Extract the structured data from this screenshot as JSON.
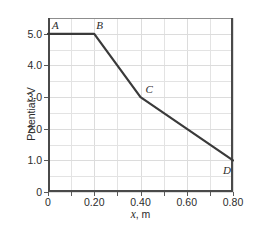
{
  "chart_data": {
    "type": "line",
    "title": "",
    "xlabel": "x, m",
    "ylabel": "Potential, V",
    "xlim": [
      0,
      0.8
    ],
    "ylim": [
      0,
      5.5
    ],
    "grid": true,
    "legend": "none",
    "x": [
      0.0,
      0.2,
      0.4,
      0.8
    ],
    "y": [
      5.0,
      5.0,
      3.0,
      1.0
    ],
    "point_labels": [
      "A",
      "B",
      "C",
      "D"
    ],
    "points": [
      {
        "label": "A",
        "x": 0.0,
        "y": 5.0
      },
      {
        "label": "B",
        "x": 0.2,
        "y": 5.0
      },
      {
        "label": "C",
        "x": 0.4,
        "y": 3.0
      },
      {
        "label": "D",
        "x": 0.8,
        "y": 1.0
      }
    ],
    "xticks": [
      {
        "value": 0.0,
        "label": "0"
      },
      {
        "value": 0.2,
        "label": "0.20"
      },
      {
        "value": 0.4,
        "label": "0.40"
      },
      {
        "value": 0.6,
        "label": "0.60"
      },
      {
        "value": 0.8,
        "label": "0.80"
      }
    ],
    "yticks": [
      {
        "value": 0.0,
        "label": "0"
      },
      {
        "value": 1.0,
        "label": "1.0"
      },
      {
        "value": 2.0,
        "label": "2.0"
      },
      {
        "value": 3.0,
        "label": "3.0"
      },
      {
        "value": 4.0,
        "label": "4.0"
      },
      {
        "value": 5.0,
        "label": "5.0"
      }
    ],
    "minor_x_step": 0.1,
    "minor_y_step": 0.5,
    "colors": {
      "line": "#3a3a3a",
      "axis": "#4a4a4a",
      "grid": "#e3e3e3",
      "text": "#2b2b2b",
      "background": "#ffffff"
    },
    "line_width": 2.2
  }
}
